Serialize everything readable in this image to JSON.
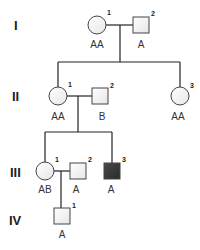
{
  "diagram": {
    "type": "pedigree",
    "colors": {
      "unaffected_fill": "#f2f2f2",
      "affected_fill": "#3a3a3a",
      "stroke": "#444444",
      "line": "#222222"
    },
    "generations": [
      {
        "label": "I",
        "members": [
          {
            "id": "I-1",
            "number": "1",
            "sex": "female",
            "affected": false,
            "genotype": "AA"
          },
          {
            "id": "I-2",
            "number": "2",
            "sex": "male",
            "affected": false,
            "genotype": "A"
          }
        ]
      },
      {
        "label": "II",
        "members": [
          {
            "id": "II-1",
            "number": "1",
            "sex": "female",
            "affected": false,
            "genotype": "AA"
          },
          {
            "id": "II-2",
            "number": "2",
            "sex": "male",
            "affected": false,
            "genotype": "B"
          },
          {
            "id": "II-3",
            "number": "3",
            "sex": "female",
            "affected": false,
            "genotype": "AA"
          }
        ]
      },
      {
        "label": "III",
        "members": [
          {
            "id": "III-1",
            "number": "1",
            "sex": "female",
            "affected": false,
            "genotype": "AB"
          },
          {
            "id": "III-2",
            "number": "2",
            "sex": "male",
            "affected": false,
            "genotype": "A"
          },
          {
            "id": "III-3",
            "number": "3",
            "sex": "male",
            "affected": true,
            "genotype": "A"
          }
        ]
      },
      {
        "label": "IV",
        "members": [
          {
            "id": "IV-1",
            "number": "1",
            "sex": "male",
            "affected": false,
            "genotype": "A"
          }
        ]
      }
    ]
  }
}
